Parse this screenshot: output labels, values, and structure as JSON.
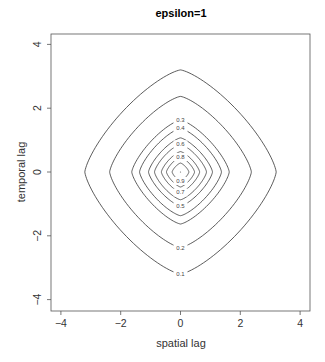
{
  "chart_data": {
    "type": "contour",
    "title": "epsilon=1",
    "xlabel": "spatial lag",
    "ylabel": "temporal lag",
    "xlim": [
      -4.3,
      4.3
    ],
    "ylim": [
      -4.3,
      4.3
    ],
    "xticks": [
      -4,
      -2,
      0,
      2,
      4
    ],
    "yticks": [
      -4,
      -2,
      0,
      2,
      4
    ],
    "xtick_labels": [
      "−4",
      "−2",
      "0",
      "2",
      "4"
    ],
    "ytick_labels": [
      "−4",
      "−2",
      "0",
      "2",
      "4"
    ],
    "grid": false,
    "legend": null,
    "contour_levels": [
      0.1,
      0.2,
      0.3,
      0.4,
      0.5,
      0.6,
      0.7,
      0.8,
      0.9
    ],
    "contour_labels": [
      "0.1",
      "0.2",
      "0.3",
      "0.4",
      "0.5",
      "0.6",
      "0.7",
      "0.8",
      "0.9"
    ],
    "contour_radius_units": [
      3.2,
      2.37,
      1.63,
      1.37,
      1.07,
      0.87,
      0.64,
      0.47,
      0.28
    ],
    "contour_label_position": [
      "bottom",
      "bottom",
      "top",
      "top",
      "bottom",
      "top",
      "bottom",
      "top",
      "bottom"
    ],
    "contour_shape": "rounded diamond, symmetric in spatial and temporal lag, centered at (0,0)",
    "peak": {
      "x": 0,
      "y": 0,
      "value": 1.0
    }
  }
}
